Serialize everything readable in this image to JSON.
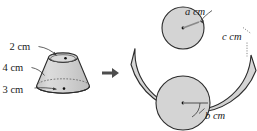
{
  "figure": {
    "transform_arrow": "right-arrow",
    "fill_color": "#d4d4d4",
    "stroke_color": "#2b2b2b",
    "label_color": "#1a1a1a"
  },
  "solid": {
    "name": "frustum",
    "labels": {
      "top_radius": "2 cm",
      "slant_height": "4 cm",
      "bottom_radius": "3 cm"
    }
  },
  "net": {
    "name": "frustum-net",
    "parts": {
      "small_circle_label": "a cm",
      "band_label": "c cm",
      "large_circle_label": "b cm"
    }
  }
}
